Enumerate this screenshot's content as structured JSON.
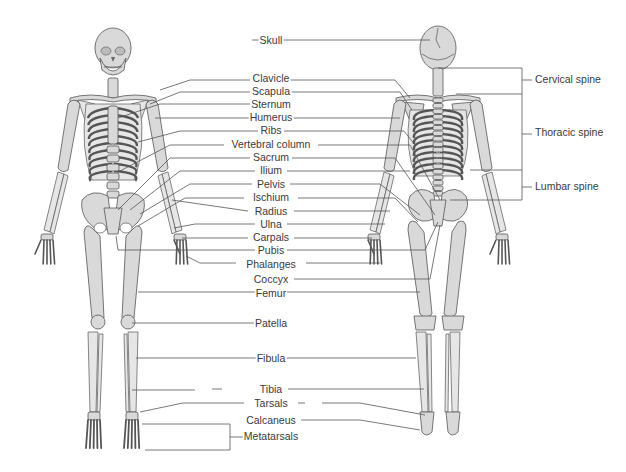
{
  "diagram": {
    "views": [
      "anterior",
      "posterior"
    ],
    "center_labels": [
      {
        "id": "skull",
        "text": "Skull"
      },
      {
        "id": "clavicle",
        "text": "Clavicle"
      },
      {
        "id": "scapula",
        "text": "Scapula"
      },
      {
        "id": "sternum",
        "text": "Sternum"
      },
      {
        "id": "humerus",
        "text": "Humerus"
      },
      {
        "id": "ribs",
        "text": "Ribs"
      },
      {
        "id": "vertebral-column",
        "text": "Vertebral column"
      },
      {
        "id": "sacrum",
        "text": "Sacrum"
      },
      {
        "id": "ilium",
        "text": "Ilium"
      },
      {
        "id": "pelvis",
        "text": "Pelvis"
      },
      {
        "id": "ischium",
        "text": "Ischium"
      },
      {
        "id": "radius",
        "text": "Radius"
      },
      {
        "id": "ulna",
        "text": "Ulna"
      },
      {
        "id": "carpals",
        "text": "Carpals"
      },
      {
        "id": "pubis",
        "text": "Pubis"
      },
      {
        "id": "phalanges",
        "text": "Phalanges"
      },
      {
        "id": "coccyx",
        "text": "Coccyx"
      },
      {
        "id": "femur",
        "text": "Femur"
      },
      {
        "id": "patella",
        "text": "Patella"
      },
      {
        "id": "fibula",
        "text": "Fibula"
      },
      {
        "id": "tibia",
        "text": "Tibia"
      },
      {
        "id": "tarsals",
        "text": "Tarsals"
      },
      {
        "id": "calcaneus",
        "text": "Calcaneus"
      },
      {
        "id": "metatarsals",
        "text": "Metatarsals"
      }
    ],
    "spine_labels": [
      {
        "id": "cervical-spine",
        "text": "Cervical spine"
      },
      {
        "id": "thoracic-spine",
        "text": "Thoracic spine"
      },
      {
        "id": "lumbar-spine",
        "text": "Lumbar spine"
      }
    ]
  }
}
